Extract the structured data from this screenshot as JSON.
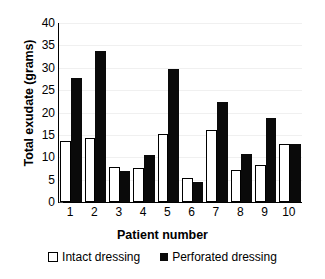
{
  "chart_data": {
    "type": "bar",
    "title": "",
    "xlabel": "Patient number",
    "ylabel": "Total exudate (grams)",
    "categories": [
      "1",
      "2",
      "3",
      "4",
      "5",
      "6",
      "7",
      "8",
      "9",
      "10"
    ],
    "series": [
      {
        "name": "Intact dressing",
        "color": "#ffffff",
        "values": [
          13.6,
          14.3,
          7.9,
          7.6,
          15.2,
          5.4,
          16.0,
          7.1,
          8.3,
          13.0
        ]
      },
      {
        "name": "Perforated dressing",
        "color": "#0a0a0a",
        "values": [
          27.7,
          33.7,
          6.9,
          10.6,
          29.8,
          4.5,
          22.3,
          10.7,
          18.8,
          13.0
        ]
      }
    ],
    "ylim": [
      0,
      40
    ],
    "yticks": [
      0,
      5,
      10,
      15,
      20,
      25,
      30,
      35,
      40
    ],
    "ytick_labels": [
      "0",
      "5",
      "10",
      "15",
      "20",
      "25",
      "30",
      "35",
      "40"
    ],
    "grid": false,
    "legend_position": "bottom"
  },
  "legend": {
    "items": [
      {
        "label": "Intact dressing",
        "marker": "open-square-marker"
      },
      {
        "label": "Perforated dressing",
        "marker": "filled-square-marker"
      }
    ]
  }
}
